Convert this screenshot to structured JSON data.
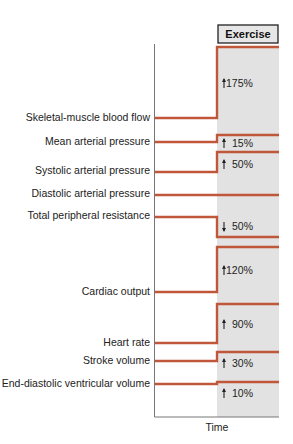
{
  "header": {
    "phase_label": "Exercise"
  },
  "axis": {
    "x_label": "Time"
  },
  "colors": {
    "trace": "#c0573a",
    "exercise_bg": "#e2e2e2",
    "axis": "#777777",
    "box_bg": "#e6e6e6",
    "box_border": "#222222"
  },
  "chart_data": {
    "type": "line",
    "xlabel": "Time",
    "phases": [
      "Rest",
      "Exercise"
    ],
    "series": [
      {
        "name": "Skeletal-muscle blood flow",
        "direction": "up",
        "change": "175%",
        "y_rest": 118,
        "y_ex": 47
      },
      {
        "name": "Mean arterial pressure",
        "direction": "up",
        "change": "15%",
        "y_rest": 142,
        "y_ex": 135
      },
      {
        "name": "Systolic arterial pressure",
        "direction": "up",
        "change": "50%",
        "y_rest": 172,
        "y_ex": 152
      },
      {
        "name": "Diastolic arterial pressure",
        "direction": "none",
        "change": "",
        "y_rest": 195,
        "y_ex": 195
      },
      {
        "name": "Total peripheral resistance",
        "direction": "down",
        "change": "50%",
        "y_rest": 217,
        "y_ex": 237
      },
      {
        "name": "Cardiac output",
        "direction": "up",
        "change": "120%",
        "y_rest": 292,
        "y_ex": 247
      },
      {
        "name": "Heart rate",
        "direction": "up",
        "change": "90%",
        "y_rest": 343,
        "y_ex": 304
      },
      {
        "name": "Stroke volume",
        "direction": "up",
        "change": "30%",
        "y_rest": 361,
        "y_ex": 352
      },
      {
        "name": "End-diastolic ventricular volume",
        "direction": "up",
        "change": "10%",
        "y_rest": 384,
        "y_ex": 382
      }
    ]
  },
  "labels": [
    {
      "text": "Skeletal-muscle blood flow",
      "y": 121
    },
    {
      "text": "Mean arterial pressure",
      "y": 145
    },
    {
      "text": "Systolic arterial pressure",
      "y": 174
    },
    {
      "text": "Diastolic arterial pressure",
      "y": 197
    },
    {
      "text": "Total peripheral resistance",
      "y": 219
    },
    {
      "text": "Cardiac output",
      "y": 295
    },
    {
      "text": "Heart rate",
      "y": 346
    },
    {
      "text": "Stroke volume",
      "y": 364
    },
    {
      "text": "End-diastolic ventricular volume",
      "y": 387
    }
  ],
  "annotations": [
    {
      "arrow": "up",
      "text": "175%",
      "y": 87
    },
    {
      "arrow": "up",
      "text": "15%",
      "y": 147
    },
    {
      "arrow": "up",
      "text": "50%",
      "y": 168
    },
    {
      "arrow": "down",
      "text": "50%",
      "y": 230
    },
    {
      "arrow": "up",
      "text": "120%",
      "y": 274
    },
    {
      "arrow": "up",
      "text": "90%",
      "y": 328
    },
    {
      "arrow": "up",
      "text": "30%",
      "y": 367
    },
    {
      "arrow": "up",
      "text": "10%",
      "y": 397
    }
  ]
}
